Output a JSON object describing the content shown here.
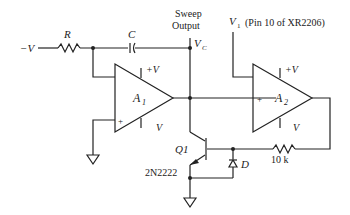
{
  "labels": {
    "neg_v": "−V",
    "r": "R",
    "c": "C",
    "sweep_line1": "Sweep",
    "sweep_line2": "Output",
    "vc": "V",
    "vc_sub": "C",
    "v1": "V",
    "v1_sub": "1",
    "v1_note": "(Pin 10 of XR2206)",
    "a1": "A",
    "a1_sub": "1",
    "a2": "A",
    "a2_sub": "2",
    "plus_v": "+V",
    "minus_v": "V",
    "plus_sign": "+",
    "q1": "Q1",
    "q1_part": "2N2222",
    "d": "D",
    "r10k": "10 k"
  }
}
